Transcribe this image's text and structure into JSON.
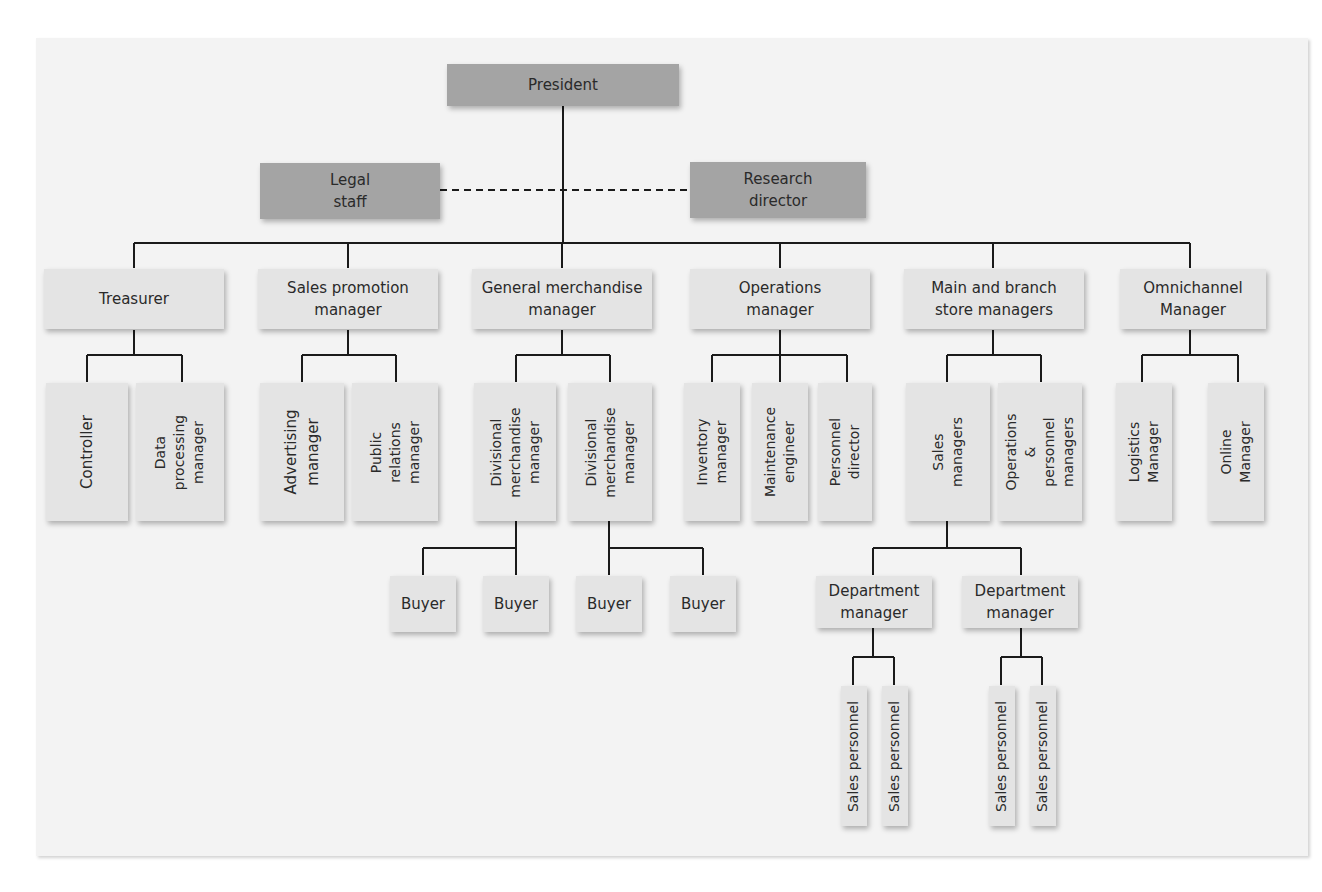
{
  "chart": {
    "top": {
      "president": "President"
    },
    "staff": {
      "legal": "Legal\nstaff",
      "research": "Research\ndirector"
    },
    "level2": [
      {
        "id": "treasurer",
        "label": "Treasurer"
      },
      {
        "id": "sales_promo",
        "label": "Sales promotion\nmanager"
      },
      {
        "id": "gen_merch",
        "label": "General merchandise\nmanager"
      },
      {
        "id": "operations",
        "label": "Operations\nmanager"
      },
      {
        "id": "store_mgrs",
        "label": "Main and branch\nstore managers"
      },
      {
        "id": "omnichannel",
        "label": "Omnichannel\nManager"
      }
    ],
    "level3": {
      "controller": "Controller",
      "data_processing": "Data\nprocessing\nmanager",
      "advertising": "Advertising\nmanager",
      "public_relations": "Public\nrelations\nmanager",
      "div_merch_1": "Divisional\nmerchandise\nmanager",
      "div_merch_2": "Divisional\nmerchandise\nmanager",
      "inventory": "Inventory\nmanager",
      "maintenance": "Maintenance\nengineer",
      "personnel": "Personnel\ndirector",
      "sales_managers": "Sales\nmanagers",
      "ops_personnel": "Operations &\npersonnel\nmanagers",
      "logistics": "Logistics\nManager",
      "online": "Online\nManager"
    },
    "buyers": [
      "Buyer",
      "Buyer",
      "Buyer",
      "Buyer"
    ],
    "department_managers": [
      "Department\nmanager",
      "Department\nmanager"
    ],
    "sales_personnel": [
      "Sales personnel",
      "Sales personnel",
      "Sales personnel",
      "Sales personnel"
    ]
  },
  "colors": {
    "top_box": "#a4a4a4",
    "box": "#e4e4e4",
    "line": "#1a1a1a",
    "background": "#f3f3f3"
  }
}
